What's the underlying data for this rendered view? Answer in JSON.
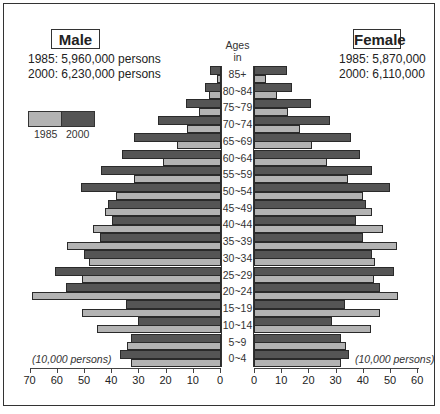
{
  "chart_data": {
    "type": "bar",
    "subtype": "population-pyramid",
    "title": "",
    "center_label": "Ages in years",
    "unit": "(10,000 persons)",
    "categories": [
      "85+",
      "80~84",
      "75~79",
      "70~74",
      "65~69",
      "60~64",
      "55~59",
      "50~54",
      "45~49",
      "40~44",
      "35~39",
      "30~34",
      "25~29",
      "20~24",
      "15~19",
      "10~14",
      "5~9",
      "0~4"
    ],
    "series": [
      {
        "name": "Male 2000",
        "side": "left",
        "year": "2000",
        "color": "#555555",
        "values": [
          4,
          6,
          13,
          23,
          32,
          36.5,
          44,
          51.5,
          41.5,
          40,
          44.5,
          50.5,
          61,
          57,
          35,
          30.5,
          33,
          37
        ]
      },
      {
        "name": "Male 1985",
        "side": "left",
        "year": "1985",
        "color": "#b3b3b3",
        "values": [
          1.5,
          4.5,
          8,
          12.5,
          16,
          21.5,
          32,
          38.5,
          42.5,
          47,
          56.5,
          48.5,
          51,
          69.5,
          51,
          45.5,
          34.5,
          33
        ]
      },
      {
        "name": "Female 2000",
        "side": "right",
        "year": "2000",
        "color": "#555555",
        "values": [
          12,
          14,
          21,
          28,
          35.5,
          39,
          43.5,
          50,
          41,
          37.5,
          40,
          43.5,
          51.5,
          46.5,
          33.5,
          28.5,
          32,
          35
        ]
      },
      {
        "name": "Female 1985",
        "side": "right",
        "year": "1985",
        "color": "#b3b3b3",
        "values": [
          4.5,
          8.5,
          12.5,
          17,
          21.5,
          27,
          34.5,
          40,
          43.5,
          47.5,
          52.5,
          44.5,
          44,
          53,
          46.5,
          43,
          34,
          32
        ]
      }
    ],
    "left_axis": {
      "ticks": [
        70,
        60,
        50,
        40,
        30,
        20,
        10,
        0
      ],
      "range": [
        70,
        0
      ]
    },
    "right_axis": {
      "ticks": [
        0,
        10,
        20,
        30,
        40,
        50,
        60
      ],
      "range": [
        0,
        60
      ]
    },
    "legend": [
      {
        "label": "1985",
        "color": "#b3b3b3"
      },
      {
        "label": "2000",
        "color": "#555555"
      }
    ],
    "legend_position": "upper-left",
    "grid": false
  },
  "male": {
    "title": "Male",
    "total_1985": "1985: 5,960,000 persons",
    "total_2000": "2000: 6,230,000 persons",
    "unit": "(10,000 persons)"
  },
  "female": {
    "title": "Female",
    "total_1985": "1985: 5,870,000",
    "total_2000": "2000: 6,110,000",
    "unit": "(10,000 persons)"
  },
  "ages_header": {
    "line1": "Ages",
    "line2": "in years"
  },
  "legend": {
    "label_1985": "1985",
    "label_2000": "2000"
  },
  "axis": {
    "left_ticks": [
      "70",
      "60",
      "50",
      "40",
      "30",
      "20",
      "10",
      "0"
    ],
    "right_ticks": [
      "0",
      "10",
      "20",
      "30",
      "40",
      "50",
      "60"
    ]
  }
}
